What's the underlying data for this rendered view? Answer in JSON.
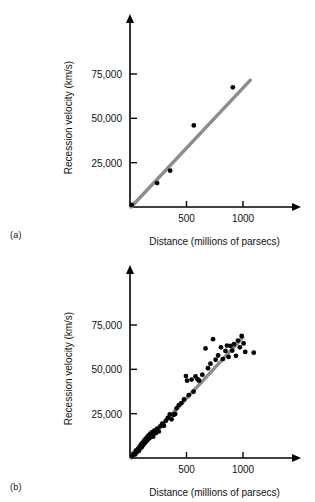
{
  "figure": {
    "panels": [
      {
        "tag": "(a)"
      },
      {
        "tag": "(b)"
      }
    ]
  },
  "chart_data": [
    {
      "type": "scatter",
      "panel": "(a)",
      "title": "",
      "xlabel": "Distance (millions of parsecs)",
      "ylabel": "Recession velocity (km/s)",
      "xlim": [
        0,
        1300
      ],
      "ylim": [
        0,
        95000
      ],
      "xticks": [
        500,
        1000
      ],
      "xticklabels": [
        "500",
        "1000"
      ],
      "yticks": [
        25000,
        50000,
        75000
      ],
      "yticklabels": [
        "25,000",
        "50,000",
        "75,000"
      ],
      "grid": false,
      "legend": "none",
      "series": [
        {
          "name": "Galaxies",
          "marker": "filled-circle",
          "color": "#050505",
          "points": [
            [
              15,
              1200
            ],
            [
              240,
              13500
            ],
            [
              355,
              20500
            ],
            [
              565,
              46000
            ],
            [
              910,
              67500
            ]
          ]
        }
      ],
      "fit_line": {
        "name": "Hubble's law fit",
        "color": "#8c8c8c",
        "x_start": 10,
        "y_start": 0,
        "x_end": 1065,
        "y_end": 71500
      }
    },
    {
      "type": "scatter",
      "panel": "(b)",
      "title": "",
      "xlabel": "Distance (millions of parsecs)",
      "ylabel": "Recession velocity (km/s)",
      "xlim": [
        0,
        1300
      ],
      "ylim": [
        0,
        95000
      ],
      "xticks": [
        500,
        1000
      ],
      "xticklabels": [
        "500",
        "1000"
      ],
      "yticks": [
        25000,
        50000,
        75000
      ],
      "yticklabels": [
        "25,000",
        "50,000",
        "75,000"
      ],
      "grid": false,
      "legend": "none",
      "series": [
        {
          "name": "Galaxies",
          "marker": "filled-circle",
          "color": "#050505",
          "points": [
            [
              18,
              1000
            ],
            [
              30,
              2400
            ],
            [
              45,
              2000
            ],
            [
              52,
              4200
            ],
            [
              60,
              3200
            ],
            [
              70,
              5200
            ],
            [
              78,
              4000
            ],
            [
              85,
              6400
            ],
            [
              92,
              5400
            ],
            [
              98,
              7600
            ],
            [
              105,
              6200
            ],
            [
              112,
              8600
            ],
            [
              118,
              7400
            ],
            [
              125,
              9800
            ],
            [
              130,
              8400
            ],
            [
              138,
              10800
            ],
            [
              145,
              9400
            ],
            [
              152,
              11800
            ],
            [
              158,
              10400
            ],
            [
              165,
              12800
            ],
            [
              172,
              11200
            ],
            [
              180,
              13800
            ],
            [
              188,
              12400
            ],
            [
              196,
              14600
            ],
            [
              205,
              12000
            ],
            [
              215,
              15400
            ],
            [
              228,
              14000
            ],
            [
              240,
              16600
            ],
            [
              255,
              15000
            ],
            [
              268,
              17800
            ],
            [
              285,
              19400
            ],
            [
              300,
              18200
            ],
            [
              318,
              21000
            ],
            [
              335,
              22600
            ],
            [
              352,
              24600
            ],
            [
              368,
              21800
            ],
            [
              385,
              24400
            ],
            [
              400,
              24800
            ],
            [
              412,
              28000
            ],
            [
              432,
              29800
            ],
            [
              455,
              31000
            ],
            [
              478,
              33000
            ],
            [
              495,
              46200
            ],
            [
              505,
              43600
            ],
            [
              520,
              35400
            ],
            [
              545,
              44200
            ],
            [
              562,
              37400
            ],
            [
              580,
              46000
            ],
            [
              598,
              44400
            ],
            [
              612,
              43600
            ],
            [
              640,
              47000
            ],
            [
              668,
              61800
            ],
            [
              690,
              50600
            ],
            [
              712,
              53200
            ],
            [
              735,
              67000
            ],
            [
              758,
              55400
            ],
            [
              780,
              57800
            ],
            [
              805,
              62400
            ],
            [
              822,
              55800
            ],
            [
              845,
              60400
            ],
            [
              858,
              63400
            ],
            [
              872,
              57000
            ],
            [
              890,
              63200
            ],
            [
              905,
              60600
            ],
            [
              920,
              64200
            ],
            [
              938,
              57600
            ],
            [
              955,
              66200
            ],
            [
              972,
              62400
            ],
            [
              988,
              68800
            ],
            [
              1005,
              64600
            ],
            [
              1020,
              59800
            ],
            [
              1095,
              59400
            ]
          ]
        }
      ],
      "fit_line": {
        "name": "Hubble's law fit",
        "color": "#8c8c8c",
        "x_start": 10,
        "y_start": 0,
        "x_end": 1000,
        "y_end": 68000
      }
    }
  ]
}
